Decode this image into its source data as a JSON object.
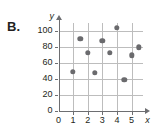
{
  "figure": {
    "part_label": "B.",
    "x_axis_name": "x",
    "y_axis_name": "y"
  },
  "chart_data": {
    "type": "scatter",
    "title": "",
    "xlabel": "x",
    "ylabel": "y",
    "xlim": [
      0,
      5.8
    ],
    "ylim": [
      0,
      110
    ],
    "xticks": [
      0,
      1,
      2,
      3,
      4,
      5
    ],
    "yticks": [
      0,
      20,
      40,
      60,
      80,
      100
    ],
    "xtick_labels": [
      "0",
      "1",
      "2",
      "3",
      "4",
      "5"
    ],
    "ytick_labels": [
      "0",
      "20",
      "40",
      "60",
      "80",
      "100"
    ],
    "grid": true,
    "legend": null,
    "marker_color": "#6a6a6d",
    "grid_color": "#bdbdbd",
    "axis_color": "#6d6e71",
    "points": [
      {
        "x": 1.0,
        "y": 48
      },
      {
        "x": 1.5,
        "y": 90
      },
      {
        "x": 2.0,
        "y": 72
      },
      {
        "x": 2.5,
        "y": 47
      },
      {
        "x": 3.0,
        "y": 87
      },
      {
        "x": 3.5,
        "y": 72
      },
      {
        "x": 4.0,
        "y": 103
      },
      {
        "x": 4.5,
        "y": 38
      },
      {
        "x": 5.0,
        "y": 69
      },
      {
        "x": 5.5,
        "y": 79
      }
    ]
  }
}
